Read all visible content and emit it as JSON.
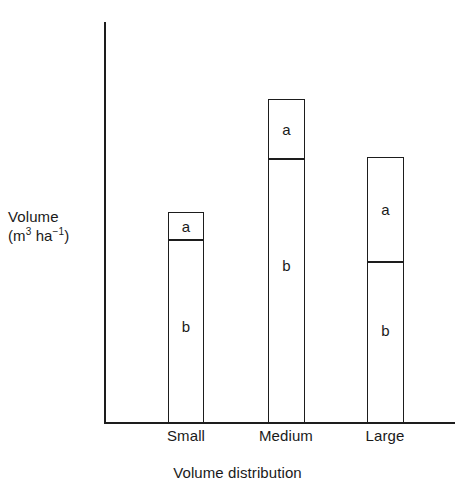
{
  "chart_data": {
    "type": "bar",
    "title": "",
    "subtitle": "",
    "xlabel": "Volume distribution",
    "ylabel_line1": "Volume",
    "ylabel_line2_prefix": "(m",
    "ylabel_line2_sup1": "3",
    "ylabel_line2_mid": " ha",
    "ylabel_line2_sup2": "−1",
    "ylabel_line2_suffix": ")",
    "ylabel_full": "Volume (m3 ha-1)",
    "categories": [
      "Small",
      "Medium",
      "Large"
    ],
    "stacked": true,
    "grid": false,
    "legend": "none",
    "axis_ticks": "none",
    "ylim": [
      0,
      380
    ],
    "series": [
      {
        "name": "b",
        "label": "b",
        "values": [
          183,
          264,
          161
        ]
      },
      {
        "name": "a",
        "label": "a",
        "values": [
          28,
          60,
          105
        ]
      }
    ],
    "totals": [
      211,
      324,
      266
    ],
    "bars": [
      {
        "category": "Small",
        "total": 211,
        "segments": [
          {
            "label": "a",
            "value": 28
          },
          {
            "label": "b",
            "value": 183
          }
        ]
      },
      {
        "category": "Medium",
        "total": 324,
        "segments": [
          {
            "label": "a",
            "value": 60
          },
          {
            "label": "b",
            "value": 264
          }
        ]
      },
      {
        "category": "Large",
        "total": 266,
        "segments": [
          {
            "label": "a",
            "value": 105
          },
          {
            "label": "b",
            "value": 161
          }
        ]
      }
    ],
    "colors": {
      "bar_fill": "#ffffff",
      "bar_stroke": "#1d1d1d",
      "axis": "#1d1d1d",
      "text": "#1a1a1a",
      "background": "#ffffff"
    }
  }
}
